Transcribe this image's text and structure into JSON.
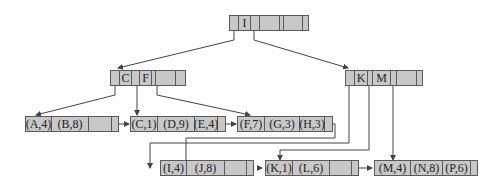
{
  "colors": {
    "node_fill": "#c8c8c8",
    "node_border": "#5a5a5a",
    "line": "#444444",
    "background": "#ffffff"
  },
  "root": {
    "keys": [
      "I",
      "",
      ""
    ]
  },
  "internal": [
    {
      "id": "left",
      "keys": [
        "C",
        "F",
        ""
      ]
    },
    {
      "id": "right",
      "keys": [
        "K",
        "M",
        ""
      ]
    }
  ],
  "leaves": [
    {
      "id": "leaf1",
      "entries": [
        "(A,4)",
        "(B,8)",
        ""
      ]
    },
    {
      "id": "leaf2",
      "entries": [
        "(C,1)",
        "(D,9)",
        "(E,4)"
      ]
    },
    {
      "id": "leaf3",
      "entries": [
        "(F,7)",
        "(G,3)",
        "(H,3)"
      ]
    },
    {
      "id": "leaf4",
      "entries": [
        "(I,4)",
        "(J,8)",
        ""
      ]
    },
    {
      "id": "leaf5",
      "entries": [
        "(K,1)",
        "(L,6)",
        ""
      ]
    },
    {
      "id": "leaf6",
      "entries": [
        "(M,4)",
        "(N,8)",
        "(P,6)"
      ]
    }
  ]
}
